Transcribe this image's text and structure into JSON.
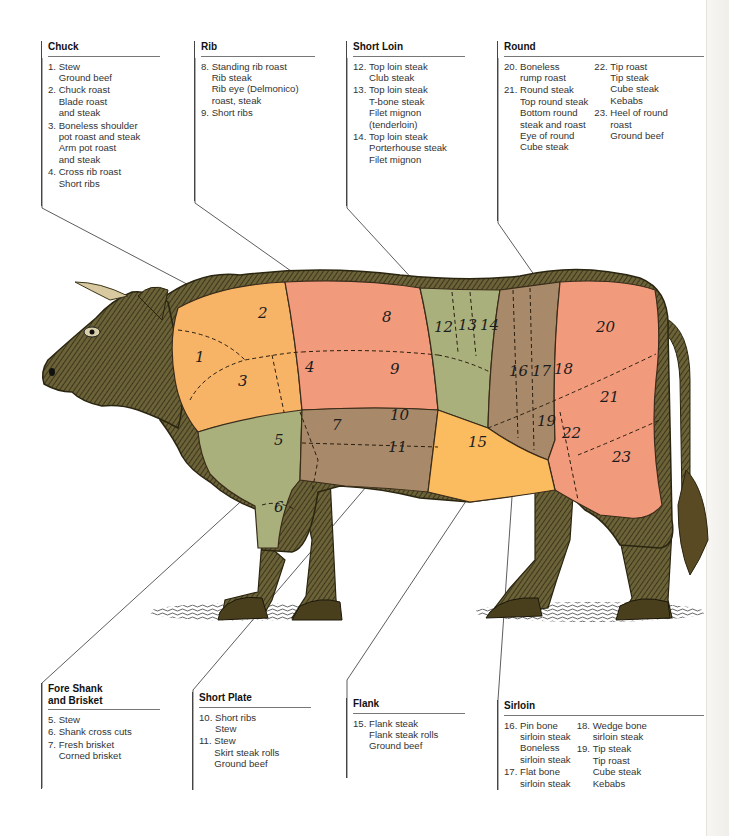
{
  "colors": {
    "chuck": "#f7b366",
    "rib": "#f29a7c",
    "short_loin": "#a9b07c",
    "sirloin": "#a8896a",
    "round": "#f29a7c",
    "flank": "#fbbb5f",
    "fore_shank_brisket": "#a9b07c",
    "short_plate": "#a8896a",
    "hide": "#5b5230"
  },
  "sections": {
    "chuck": {
      "title": "Chuck",
      "items": [
        {
          "num": "1.",
          "lines": [
            "Stew",
            "Ground beef"
          ]
        },
        {
          "num": "2.",
          "lines": [
            "Chuck roast",
            "Blade roast",
            "and steak"
          ]
        },
        {
          "num": "3.",
          "lines": [
            "Boneless shoulder",
            "pot roast and steak",
            "Arm pot roast",
            "and steak"
          ]
        },
        {
          "num": "4.",
          "lines": [
            "Cross rib roast",
            "Short ribs"
          ]
        }
      ]
    },
    "rib": {
      "title": "Rib",
      "items": [
        {
          "num": "8.",
          "lines": [
            "Standing rib roast",
            "Rib steak",
            "Rib eye (Delmonico)",
            "roast, steak"
          ]
        },
        {
          "num": "9.",
          "lines": [
            "Short ribs"
          ]
        }
      ]
    },
    "short_loin": {
      "title": "Short Loin",
      "items": [
        {
          "num": "12.",
          "lines": [
            "Top loin steak",
            "Club steak"
          ]
        },
        {
          "num": "13.",
          "lines": [
            "Top loin steak",
            "T-bone steak",
            "Filet mignon",
            "(tenderloin)"
          ]
        },
        {
          "num": "14.",
          "lines": [
            "Top loin steak",
            "Porterhouse steak",
            "Filet mignon"
          ]
        }
      ]
    },
    "round": {
      "title": "Round",
      "col1": [
        {
          "num": "20.",
          "lines": [
            "Boneless",
            "rump roast"
          ]
        },
        {
          "num": "21.",
          "lines": [
            "Round steak",
            "Top round steak",
            "Bottom round",
            "steak and roast",
            "Eye of round",
            "Cube steak"
          ]
        }
      ],
      "col2": [
        {
          "num": "22.",
          "lines": [
            "Tip roast",
            "Tip steak",
            "Cube steak",
            "Kebabs"
          ]
        },
        {
          "num": "23.",
          "lines": [
            "Heel of round",
            "roast",
            "Ground beef"
          ]
        }
      ]
    },
    "fore_shank": {
      "title_line1": "Fore Shank",
      "title_line2": "and Brisket",
      "items": [
        {
          "num": "5.",
          "lines": [
            "Stew"
          ]
        },
        {
          "num": "6.",
          "lines": [
            "Shank cross cuts"
          ]
        },
        {
          "num": "7.",
          "lines": [
            "Fresh brisket",
            "Corned brisket"
          ]
        }
      ]
    },
    "short_plate": {
      "title": "Short Plate",
      "items": [
        {
          "num": "10.",
          "lines": [
            "Short ribs",
            "Stew"
          ]
        },
        {
          "num": "11.",
          "lines": [
            "Stew",
            "Skirt steak rolls",
            "Ground beef"
          ]
        }
      ]
    },
    "flank": {
      "title": "Flank",
      "items": [
        {
          "num": "15.",
          "lines": [
            "Flank steak",
            "Flank steak rolls",
            "Ground beef"
          ]
        }
      ]
    },
    "sirloin": {
      "title": "Sirloin",
      "col1": [
        {
          "num": "16.",
          "lines": [
            "Pin bone",
            "sirloin steak",
            "Boneless",
            "sirloin steak"
          ]
        },
        {
          "num": "17.",
          "lines": [
            "Flat bone",
            "sirloin steak"
          ]
        }
      ],
      "col2": [
        {
          "num": "18.",
          "lines": [
            "Wedge bone",
            "sirloin steak"
          ]
        },
        {
          "num": "19.",
          "lines": [
            "Tip steak",
            "Tip roast",
            "Cube steak",
            "Kebabs"
          ]
        }
      ]
    }
  },
  "cut_numbers": [
    "1",
    "2",
    "3",
    "4",
    "5",
    "6",
    "7",
    "8",
    "9",
    "10",
    "11",
    "12",
    "13",
    "14",
    "15",
    "16",
    "17",
    "18",
    "19",
    "20",
    "21",
    "22",
    "23"
  ]
}
